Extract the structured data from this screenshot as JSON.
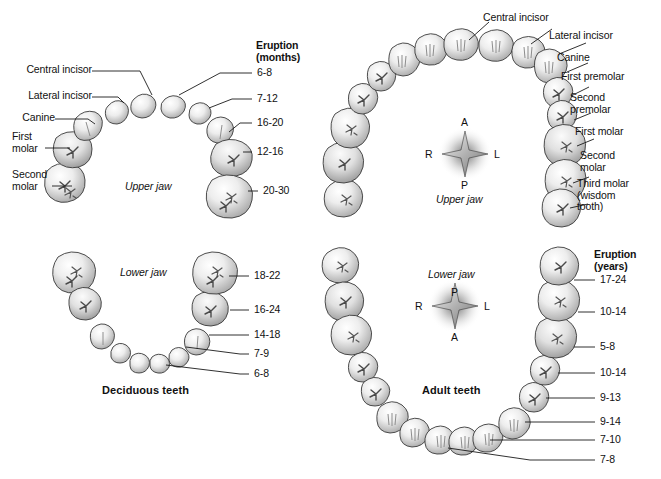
{
  "figure": {
    "background": "#ffffff",
    "ink": "#111111"
  },
  "panels": {
    "deciduous": {
      "caption": "Deciduous teeth",
      "upper": {
        "jaw_label": "Upper jaw",
        "eruption_header_line1": "Eruption",
        "eruption_header_line2": "(months)",
        "tooth_labels": [
          {
            "text": "Central incisor"
          },
          {
            "text": "Lateral incisor"
          },
          {
            "text": "Canine"
          },
          {
            "text": "First\nmolar"
          },
          {
            "text": "Second\nmolar"
          }
        ],
        "eruption_values": [
          "6-8",
          "7-12",
          "16-20",
          "12-16",
          "20-30"
        ]
      },
      "lower": {
        "jaw_label": "Lower jaw",
        "eruption_values": [
          "18-22",
          "16-24",
          "14-18",
          "7-9",
          "6-8"
        ]
      }
    },
    "adult": {
      "caption": "Adult teeth",
      "upper": {
        "jaw_label": "Upper jaw",
        "tooth_labels": [
          {
            "text": "Central incisor"
          },
          {
            "text": "Lateral incisor"
          },
          {
            "text": "Canine"
          },
          {
            "text": "First premolar"
          },
          {
            "text": "Second\npremolar"
          },
          {
            "text": "First molar"
          },
          {
            "text": "Second\nmolar"
          },
          {
            "text": "Third molar\n(wisdom\ntooth)"
          }
        ],
        "compass": {
          "top": "A",
          "bottom": "P",
          "left": "R",
          "right": "L"
        }
      },
      "lower": {
        "jaw_label": "Lower jaw",
        "eruption_header_line1": "Eruption",
        "eruption_header_line2": "(years)",
        "eruption_values": [
          "17-24",
          "10-14",
          "5-8",
          "10-14",
          "9-13",
          "9-14",
          "7-10",
          "7-8"
        ],
        "compass": {
          "top": "P",
          "bottom": "A",
          "left": "R",
          "right": "L"
        }
      }
    }
  }
}
